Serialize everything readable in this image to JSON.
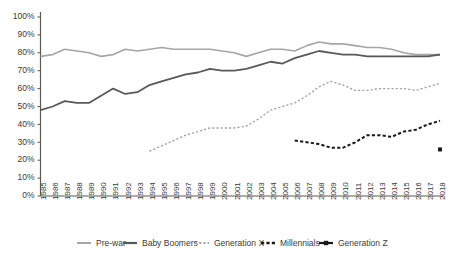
{
  "chart_data": {
    "type": "line",
    "title": "",
    "xlabel": "",
    "ylabel": "",
    "ylim": [
      0,
      100
    ],
    "ytick_labels": [
      "0%",
      "10%",
      "20%",
      "30%",
      "40%",
      "50%",
      "60%",
      "70%",
      "80%",
      "90%",
      "100%"
    ],
    "ytick_values": [
      0,
      10,
      20,
      30,
      40,
      50,
      60,
      70,
      80,
      90,
      100
    ],
    "grid": false,
    "legend_position": "bottom",
    "x": [
      1985,
      1986,
      1987,
      1988,
      1989,
      1990,
      1991,
      1992,
      1993,
      1994,
      1995,
      1996,
      1997,
      1998,
      1999,
      2000,
      2001,
      2002,
      2003,
      2004,
      2005,
      2006,
      2007,
      2008,
      2009,
      2010,
      2011,
      2012,
      2013,
      2014,
      2015,
      2016,
      2017,
      2018
    ],
    "xtick_labels": [
      "1985",
      "1986",
      "1987",
      "1988",
      "1989",
      "1990",
      "1991",
      "1992",
      "1993",
      "1994",
      "1995",
      "1996",
      "1997",
      "1998",
      "1999",
      "2000",
      "2001",
      "2002",
      "2003",
      "2004",
      "2005",
      "2006",
      "2007",
      "2008",
      "2009",
      "2010",
      "2011",
      "2012",
      "2013",
      "2014",
      "2015",
      "2016",
      "2017",
      "2018"
    ],
    "series": [
      {
        "name": "Pre-war",
        "color": "#A6A6A6",
        "style": "solid",
        "width": 1.6,
        "marker": "none",
        "x": [
          1985,
          1986,
          1987,
          1988,
          1989,
          1990,
          1991,
          1992,
          1993,
          1994,
          1995,
          1996,
          1997,
          1998,
          1999,
          2000,
          2001,
          2002,
          2003,
          2004,
          2005,
          2006,
          2007,
          2008,
          2009,
          2010,
          2011,
          2012,
          2013,
          2014,
          2015,
          2016,
          2017,
          2018
        ],
        "values": [
          78,
          79,
          82,
          81,
          80,
          78,
          79,
          82,
          81,
          82,
          83,
          82,
          82,
          82,
          82,
          81,
          80,
          78,
          80,
          82,
          82,
          81,
          84,
          86,
          85,
          85,
          84,
          83,
          83,
          82,
          80,
          79,
          79,
          79
        ]
      },
      {
        "name": "Baby Boomers",
        "color": "#595959",
        "style": "solid",
        "width": 1.8,
        "marker": "none",
        "x": [
          1985,
          1986,
          1987,
          1988,
          1989,
          1990,
          1991,
          1992,
          1993,
          1994,
          1995,
          1996,
          1997,
          1998,
          1999,
          2000,
          2001,
          2002,
          2003,
          2004,
          2005,
          2006,
          2007,
          2008,
          2009,
          2010,
          2011,
          2012,
          2013,
          2014,
          2015,
          2016,
          2017,
          2018
        ],
        "values": [
          48,
          50,
          53,
          52,
          52,
          56,
          60,
          57,
          58,
          62,
          64,
          66,
          68,
          69,
          71,
          70,
          70,
          71,
          73,
          75,
          74,
          77,
          79,
          81,
          80,
          79,
          79,
          78,
          78,
          78,
          78,
          78,
          78,
          79
        ]
      },
      {
        "name": "Generation X",
        "color": "#A6A6A6",
        "style": "dashed",
        "width": 1.4,
        "marker": "none",
        "x": [
          1994,
          1995,
          1996,
          1997,
          1998,
          1999,
          2000,
          2001,
          2002,
          2003,
          2004,
          2005,
          2006,
          2007,
          2008,
          2009,
          2010,
          2011,
          2012,
          2013,
          2014,
          2015,
          2016,
          2017,
          2018
        ],
        "values": [
          25,
          28,
          31,
          34,
          36,
          38,
          38,
          38,
          39,
          43,
          48,
          50,
          52,
          56,
          61,
          64,
          62,
          59,
          59,
          60,
          60,
          60,
          59,
          61,
          63
        ]
      },
      {
        "name": "Millennials",
        "color": "#1a1a1a",
        "style": "dashed",
        "width": 2.0,
        "marker": "none",
        "x": [
          2006,
          2007,
          2008,
          2009,
          2010,
          2011,
          2012,
          2013,
          2014,
          2015,
          2016,
          2017,
          2018
        ],
        "values": [
          31,
          30,
          29,
          27,
          27,
          30,
          34,
          34,
          33,
          36,
          37,
          40,
          42
        ]
      },
      {
        "name": "Generation Z",
        "color": "#1a1a1a",
        "style": "solid",
        "width": 1.8,
        "marker": "square",
        "x": [
          2018
        ],
        "values": [
          26
        ]
      }
    ]
  },
  "legend": {
    "items": [
      {
        "label": "Pre-war"
      },
      {
        "label": "Baby Boomers"
      },
      {
        "label": "Generation X"
      },
      {
        "label": "Millennials"
      },
      {
        "label": "Generation Z"
      }
    ]
  }
}
